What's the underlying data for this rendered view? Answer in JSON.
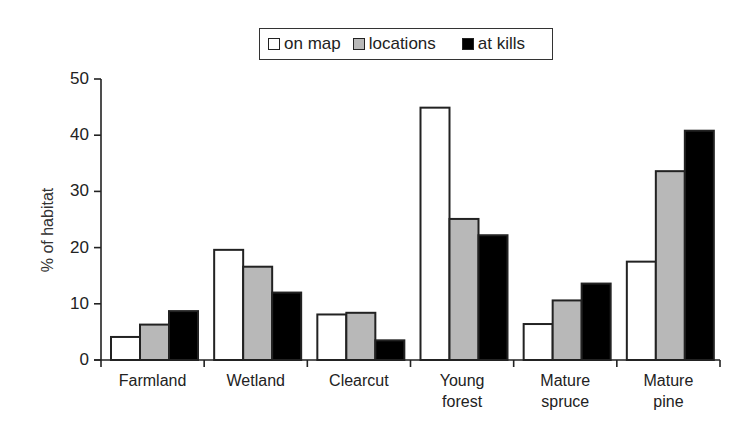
{
  "chart_data": {
    "type": "bar",
    "title": "",
    "xlabel": "",
    "ylabel": "% of habitat",
    "ylim": [
      0,
      50
    ],
    "yticks": [
      0,
      10,
      20,
      30,
      40,
      50
    ],
    "grid": false,
    "legend_position": "top-center",
    "categories": [
      "Farmland",
      "Wetland",
      "Clearcut",
      "Young forest",
      "Mature spruce",
      "Mature pine"
    ],
    "category_lines": [
      [
        "Farmland"
      ],
      [
        "Wetland"
      ],
      [
        "Clearcut"
      ],
      [
        "Young",
        "forest"
      ],
      [
        "Mature",
        "spruce"
      ],
      [
        "Mature",
        "pine"
      ]
    ],
    "series": [
      {
        "name": "on map",
        "color": "#ffffff",
        "values": [
          4.1,
          19.6,
          8.1,
          44.9,
          6.4,
          17.5
        ]
      },
      {
        "name": "locations",
        "color": "#b8b8b8",
        "values": [
          6.3,
          16.6,
          8.4,
          25.1,
          10.6,
          33.6
        ]
      },
      {
        "name": "at kills",
        "color": "#000000",
        "values": [
          8.7,
          12.0,
          3.5,
          22.2,
          13.6,
          40.8
        ]
      }
    ]
  },
  "legend": {
    "items": [
      {
        "label": "on map",
        "color": "#ffffff"
      },
      {
        "label": "locations",
        "color": "#b8b8b8"
      },
      {
        "label": "at kills",
        "color": "#000000"
      }
    ]
  },
  "axis": {
    "ylabel": "% of habitat",
    "yticks": [
      "0",
      "10",
      "20",
      "30",
      "40",
      "50"
    ]
  }
}
